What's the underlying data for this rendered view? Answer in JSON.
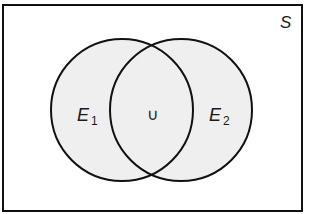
{
  "diagram": {
    "type": "venn",
    "title": "",
    "universe": {
      "label": "S",
      "x": 3,
      "y": 5,
      "width": 299,
      "height": 206
    },
    "sets": [
      {
        "label": "E",
        "subscript": "1",
        "cx": 122,
        "cy": 110,
        "r": 71
      },
      {
        "label": "E",
        "subscript": "2",
        "cx": 181,
        "cy": 110,
        "r": 71
      }
    ],
    "intersection_symbol": "∪",
    "colors": {
      "outline": "#111111",
      "fill": "#efefef",
      "background": "#ffffff"
    }
  }
}
